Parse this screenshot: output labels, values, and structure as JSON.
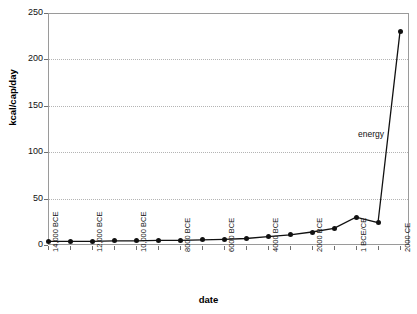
{
  "chart_data": {
    "type": "line",
    "title": "",
    "xlabel": "date",
    "ylabel": "kcal/cap/day",
    "ylim": [
      0,
      250
    ],
    "yticks": [
      0,
      50,
      100,
      150,
      200,
      250
    ],
    "grid": true,
    "legend": "none",
    "annotations": [
      {
        "text": "energy",
        "x": "1 BCE/CE",
        "y": 120
      }
    ],
    "categories": [
      "14,000 BCE",
      "13,000 BCE",
      "12,000 BCE",
      "11,000 BCE",
      "10,000 BCE",
      "9000 BCE",
      "8000 BCE",
      "7000 BCE",
      "6000 BCE",
      "5000 BCE",
      "4000 BCE",
      "3000 BCE",
      "2000 BCE",
      "1000 BCE",
      "1 BCE/CE",
      "1000 CE",
      "2000 CE"
    ],
    "xtick_labels": [
      "14,000 BCE",
      "",
      "12,000 BCE",
      "",
      "10,000 BCE",
      "",
      "8000 BCE",
      "",
      "6000 BCE",
      "",
      "4000 BCE",
      "",
      "2000 BCE",
      "",
      "1 BCE/CE",
      "",
      "2000 CE"
    ],
    "series": [
      {
        "name": "energy",
        "color": "#111111",
        "marker": "circle",
        "values": [
          4,
          4,
          4,
          4.5,
          4.5,
          5,
          5,
          5.5,
          6,
          7,
          9,
          11,
          14,
          18,
          30,
          24,
          230
        ]
      }
    ]
  },
  "colors": {
    "series": "#111111",
    "grid": "#b4b4b4",
    "frame": "#9a9a9a",
    "text": "#111111",
    "background": "#ffffff"
  }
}
